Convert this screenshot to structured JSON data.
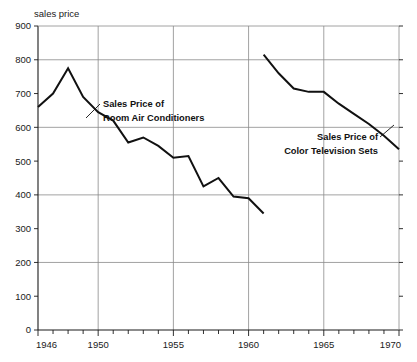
{
  "chart_data": {
    "type": "line",
    "title": "",
    "subtitle": "",
    "ylabel": "sales price",
    "xlabel": "",
    "xlim": [
      1946,
      1970
    ],
    "ylim": [
      0,
      900
    ],
    "grid": "horizontal gridlines at 200,400,600,800; vertical gridlines at 1950,1955,1960,1965",
    "legend_position": "inline annotations with leader lines",
    "y_ticks": [
      0,
      100,
      200,
      300,
      400,
      500,
      600,
      700,
      800,
      900
    ],
    "y_tick_labels": [
      "0",
      "100",
      "200",
      "300",
      "400",
      "500",
      "600",
      "700",
      "800",
      "900"
    ],
    "y_gridline_values": [
      200,
      400,
      600,
      800
    ],
    "x_ticks": [
      1946,
      1950,
      1955,
      1960,
      1965,
      1970
    ],
    "x_tick_labels": [
      "1946",
      "1950",
      "1955",
      "1960",
      "1965",
      "1970"
    ],
    "x_minor_tick_step": 1,
    "series": [
      {
        "name": "Sales Price of Room Air Conditioners",
        "annotation_lines": [
          "Sales Price of",
          "Room Air Conditioners"
        ],
        "x": [
          1946,
          1947,
          1948,
          1949,
          1950,
          1951,
          1952,
          1953,
          1954,
          1955,
          1956,
          1957,
          1958,
          1959,
          1960,
          1961
        ],
        "values": [
          660,
          700,
          775,
          690,
          645,
          620,
          555,
          570,
          545,
          510,
          515,
          425,
          450,
          395,
          390,
          345
        ]
      },
      {
        "name": "Sales Price of Color Television Sets",
        "annotation_lines": [
          "Sales Price of",
          "Color Television Sets"
        ],
        "x": [
          1961,
          1962,
          1963,
          1964,
          1965,
          1966,
          1967,
          1968,
          1969,
          1970
        ],
        "values": [
          815,
          760,
          715,
          705,
          705,
          670,
          640,
          610,
          575,
          535
        ]
      }
    ],
    "annotations": [
      {
        "label_lines": [
          "Sales Price of",
          "Room Air Conditioners"
        ],
        "target_series": "Sales Price of Room Air Conditioners"
      },
      {
        "label_lines": [
          "Sales Price of",
          "Color Television Sets"
        ],
        "target_series": "Sales Price of Color Television Sets"
      }
    ],
    "colors": {
      "line": "#111111",
      "grid": "#8a8a8a",
      "axis": "#1a1a1a",
      "background": "#ffffff"
    }
  }
}
